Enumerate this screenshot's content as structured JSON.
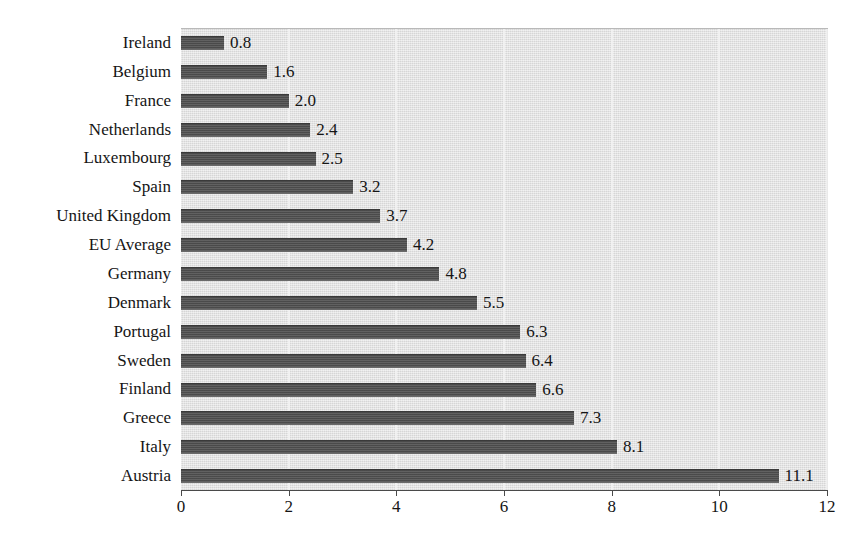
{
  "chart_data": {
    "type": "bar",
    "orientation": "horizontal",
    "title": "",
    "subtitle": "",
    "xlabel": "",
    "ylabel": "",
    "xlim": [
      0,
      12
    ],
    "ylim": null,
    "grid": true,
    "gridlines_axis": "x",
    "legend": false,
    "legend_position": "none",
    "xticks": [
      "0",
      "2",
      "4",
      "6",
      "8",
      "10",
      "12"
    ],
    "xtick_values": [
      0,
      2,
      4,
      6,
      8,
      10,
      12
    ],
    "categories": [
      "Ireland",
      "Belgium",
      "France",
      "Netherlands",
      "Luxembourg",
      "Spain",
      "United Kingdom",
      "EU Average",
      "Germany",
      "Denmark",
      "Portugal",
      "Sweden",
      "Finland",
      "Greece",
      "Italy",
      "Austria"
    ],
    "values": [
      0.8,
      1.6,
      2.0,
      2.4,
      2.5,
      3.2,
      3.7,
      4.2,
      4.8,
      5.5,
      6.3,
      6.4,
      6.6,
      7.3,
      8.1,
      11.1
    ],
    "value_labels": [
      "0.8",
      "1.6",
      "2.0",
      "2.4",
      "2.5",
      "3.2",
      "3.7",
      "4.2",
      "4.8",
      "5.5",
      "6.3",
      "6.4",
      "6.6",
      "7.3",
      "8.1",
      "11.1"
    ],
    "colors": {
      "bar": "#4f4f4f",
      "plot_background": "#dedede",
      "figure_background": "#ffffff",
      "gridline": "#f2f2f2",
      "axis": "#4a4a4a",
      "text": "#151515"
    }
  }
}
